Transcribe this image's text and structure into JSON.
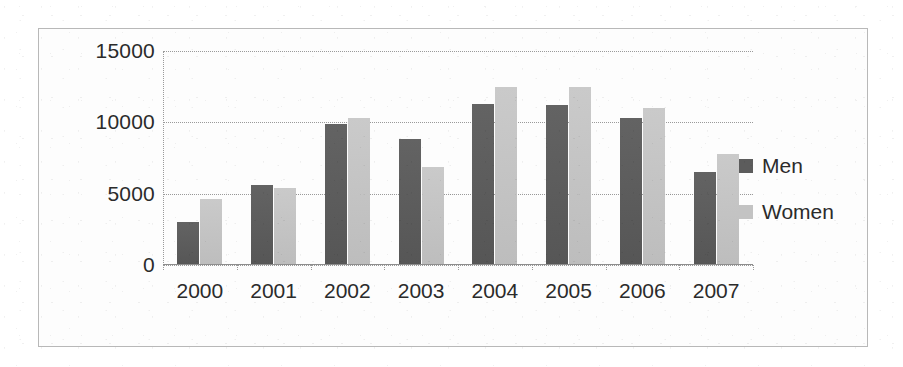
{
  "chart_data": {
    "type": "bar",
    "title": "",
    "subtitle": "",
    "xlabel": "",
    "ylabel": "",
    "categories": [
      "2000",
      "2001",
      "2002",
      "2003",
      "2004",
      "2005",
      "2006",
      "2007"
    ],
    "series": [
      {
        "name": "Men",
        "color": "#5c5c5c",
        "values": [
          3000,
          5600,
          9900,
          8800,
          11300,
          11250,
          10300,
          6500
        ]
      },
      {
        "name": "Women",
        "color": "#c3c3c3",
        "values": [
          4600,
          5400,
          10300,
          6900,
          12500,
          12500,
          11000,
          7800
        ]
      }
    ],
    "ylim": [
      0,
      15000
    ],
    "yticks": [
      0,
      5000,
      10000,
      15000
    ],
    "ytick_labels": [
      "0",
      "5000",
      "10000",
      "15000"
    ],
    "grid": true,
    "legend_position": "right",
    "legend": [
      "Men",
      "Women"
    ]
  },
  "legend": {
    "items": [
      {
        "label": "Men",
        "swatch": "men-swatch-icon"
      },
      {
        "label": "Women",
        "swatch": "women-swatch-icon"
      }
    ]
  },
  "axis": {
    "y_labels": [
      "15000",
      "10000",
      "5000",
      "0"
    ],
    "x_labels": [
      "2000",
      "2001",
      "2002",
      "2003",
      "2004",
      "2005",
      "2006",
      "2007"
    ]
  },
  "colors": {
    "men": "#5c5c5c",
    "women": "#c3c3c3",
    "grid": "#9a9a9a",
    "frame": "#b8b8b8",
    "text": "#2b2b2b",
    "background": "#ffffff"
  }
}
